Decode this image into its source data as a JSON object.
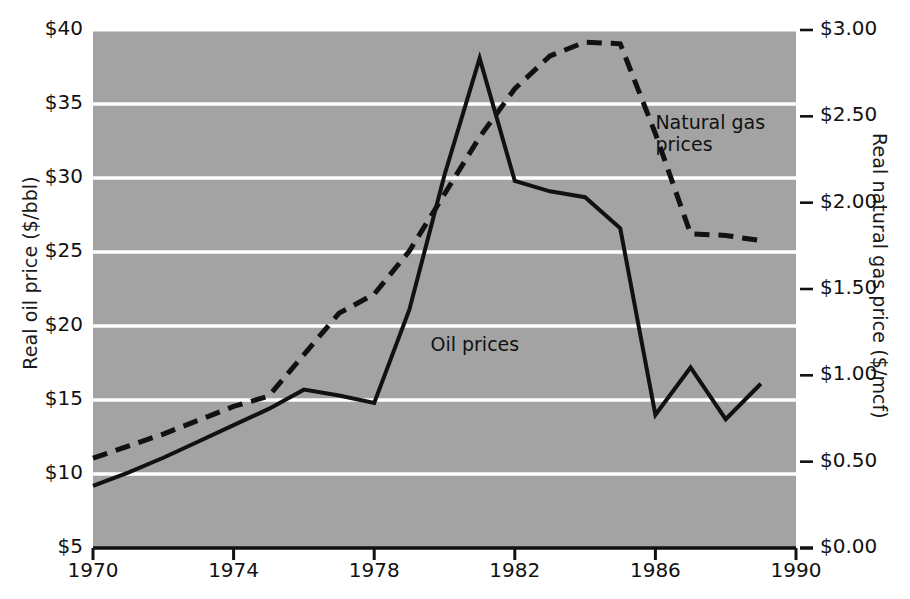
{
  "chart_data": {
    "type": "line",
    "title": "",
    "subtitle": "",
    "xlabel": "",
    "ylabel": "Real oil price ($/bbl)",
    "y2label": "Real natural gas price ($/mcf)",
    "xlim": [
      1970,
      1990
    ],
    "ylim": [
      5,
      40
    ],
    "y2lim": [
      0.0,
      3.0
    ],
    "grid": true,
    "grid_color": "#ffffff",
    "plot_background": "#a3a3a3",
    "legend_position": "inline-annotations",
    "x_ticks": [
      "1970",
      "1974",
      "1978",
      "1982",
      "1986",
      "1990"
    ],
    "x_tick_values": [
      1970,
      1974,
      1978,
      1982,
      1986,
      1990
    ],
    "y_ticks": [
      "$5",
      "$10",
      "$15",
      "$20",
      "$25",
      "$30",
      "$35",
      "$40"
    ],
    "y_tick_values": [
      5,
      10,
      15,
      20,
      25,
      30,
      35,
      40
    ],
    "y2_ticks": [
      "$0.00",
      "$0.50",
      "$1.00",
      "$1.50",
      "$2.00",
      "$2.50",
      "$3.00"
    ],
    "y2_tick_values": [
      0.0,
      0.5,
      1.0,
      1.5,
      2.0,
      2.5,
      3.0
    ],
    "x": [
      1970,
      1971,
      1972,
      1973,
      1974,
      1975,
      1976,
      1977,
      1978,
      1979,
      1980,
      1981,
      1982,
      1983,
      1984,
      1985,
      1986,
      1987,
      1988,
      1989
    ],
    "series": [
      {
        "name": "Oil prices",
        "axis": "left",
        "style": "solid",
        "color": "#111111",
        "width": 4,
        "values": [
          9.2,
          10.1,
          11.1,
          12.2,
          13.3,
          14.4,
          15.7,
          15.3,
          14.8,
          21.1,
          30.2,
          38.1,
          29.8,
          29.1,
          28.7,
          26.6,
          14.0,
          17.2,
          13.7,
          16.1
        ]
      },
      {
        "name": "Natural gas prices",
        "axis": "right",
        "style": "dashed",
        "color": "#111111",
        "width": 5,
        "values": [
          0.52,
          0.59,
          0.66,
          0.74,
          0.82,
          0.88,
          1.12,
          1.36,
          1.47,
          1.72,
          2.05,
          2.38,
          2.66,
          2.85,
          2.93,
          2.92,
          2.4,
          1.82,
          1.81,
          1.78
        ]
      }
    ],
    "annotations": [
      {
        "text": "Natural gas\nprices",
        "series": "Natural gas prices",
        "x": 1986.0,
        "y_axis_right": 2.45
      },
      {
        "text": "Oil prices",
        "series": "Oil prices",
        "x": 1979.6,
        "y_axis_left": 18.6
      }
    ]
  }
}
